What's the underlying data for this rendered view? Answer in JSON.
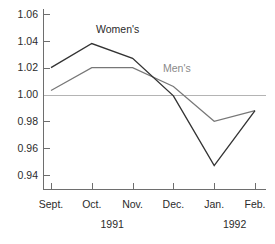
{
  "chart_data": {
    "type": "line",
    "title": "",
    "subtitle": "",
    "xlabel": "",
    "ylabel": "",
    "grid": false,
    "legend_position": "inline-annotation",
    "categories": [
      "Sept.",
      "Oct.",
      "Nov.",
      "Dec.",
      "Jan.",
      "Feb."
    ],
    "year_groups": [
      {
        "label": "1991",
        "start_index": 0,
        "end_index": 3
      },
      {
        "label": "1992",
        "start_index": 4,
        "end_index": 5
      }
    ],
    "ylim": [
      0.93,
      1.07
    ],
    "yticks": [
      "1.06",
      "1.04",
      "1.02",
      "1.00",
      "0.98",
      "0.96",
      "0.94"
    ],
    "ytick_values": [
      1.06,
      1.04,
      1.02,
      1.0,
      0.98,
      0.96,
      0.94
    ],
    "reference_line": {
      "value": 1.0,
      "color": "#b4b4b4"
    },
    "series": [
      {
        "name": "Women's",
        "color": "#333333",
        "label_text": "Women's",
        "values": [
          1.02,
          1.038,
          1.027,
          0.999,
          0.947,
          0.988
        ]
      },
      {
        "name": "Men's",
        "color": "#777777",
        "label_text": "Men's",
        "values": [
          1.003,
          1.02,
          1.02,
          1.006,
          0.98,
          0.988
        ]
      }
    ],
    "annotations": [
      {
        "text": "Women's",
        "series": "Women's",
        "x_px": 96,
        "y_px": 33
      },
      {
        "text": "Men's",
        "series": "Men's",
        "x_px": 163,
        "y_px": 72
      }
    ]
  },
  "colors": {
    "womens": "#333333",
    "mens": "#777777",
    "axis": "#6e6e6e",
    "reference": "#b4b4b4",
    "text": "#2b2b2b",
    "background": "#ffffff"
  }
}
